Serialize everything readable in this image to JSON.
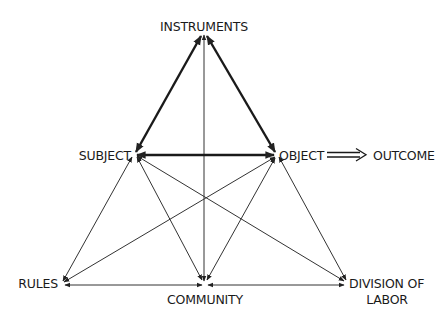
{
  "diagram": {
    "type": "activity-system-triangle",
    "colors": {
      "line": "#222222",
      "text": "#1a1a1a",
      "background": "#ffffff"
    },
    "nodes": {
      "instruments": {
        "label": "INSTRUMENTS"
      },
      "subject": {
        "label": "SUBJECT"
      },
      "object": {
        "label": "OBJECT"
      },
      "outcome": {
        "label": "OUTCOME"
      },
      "rules": {
        "label": "RULES"
      },
      "community": {
        "label": "COMMUNITY"
      },
      "division": {
        "label_line1": "DIVISION OF",
        "label_line2": "LABOR"
      }
    },
    "edges": [
      {
        "from": "SUBJECT",
        "to": "INSTRUMENTS",
        "style": "bold",
        "arrows": "both"
      },
      {
        "from": "OBJECT",
        "to": "INSTRUMENTS",
        "style": "bold",
        "arrows": "both"
      },
      {
        "from": "SUBJECT",
        "to": "OBJECT",
        "style": "bold",
        "arrows": "both"
      },
      {
        "from": "COMMUNITY",
        "to": "INSTRUMENTS",
        "style": "thin",
        "arrows": "both"
      },
      {
        "from": "RULES",
        "to": "SUBJECT",
        "style": "thin",
        "arrows": "both"
      },
      {
        "from": "RULES",
        "to": "OBJECT",
        "style": "thin",
        "arrows": "both"
      },
      {
        "from": "COMMUNITY",
        "to": "SUBJECT",
        "style": "thin",
        "arrows": "both"
      },
      {
        "from": "COMMUNITY",
        "to": "OBJECT",
        "style": "thin",
        "arrows": "both"
      },
      {
        "from": "DIVISION OF LABOR",
        "to": "SUBJECT",
        "style": "thin",
        "arrows": "both"
      },
      {
        "from": "DIVISION OF LABOR",
        "to": "OBJECT",
        "style": "thin",
        "arrows": "both"
      },
      {
        "from": "RULES",
        "to": "COMMUNITY",
        "style": "thin",
        "arrows": "both"
      },
      {
        "from": "COMMUNITY",
        "to": "DIVISION OF LABOR",
        "style": "thin",
        "arrows": "both"
      },
      {
        "from": "OBJECT",
        "to": "OUTCOME",
        "style": "double",
        "arrows": "forward"
      }
    ]
  }
}
